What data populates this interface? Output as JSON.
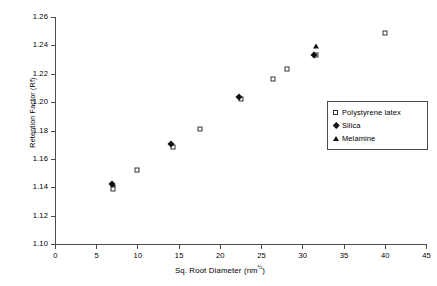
{
  "chart_data": {
    "type": "scatter",
    "title": "",
    "xlabel": "Sq. Root Diameter (nm",
    "xlabel_sup": "½",
    "xlabel_suffix": ")",
    "ylabel": "Retention Factor (Rf)",
    "xlim": [
      0,
      45
    ],
    "ylim": [
      1.1,
      1.26
    ],
    "xticks": [
      0,
      5,
      10,
      15,
      20,
      25,
      30,
      35,
      40,
      45
    ],
    "xtick_labels": [
      "0",
      "5",
      "10",
      "15",
      "20",
      "25",
      "30",
      "35",
      "40",
      "45"
    ],
    "yticks": [
      1.1,
      1.12,
      1.14,
      1.16,
      1.18,
      1.2,
      1.22,
      1.24,
      1.26
    ],
    "ytick_labels": [
      "1.10",
      "1.12",
      "1.14",
      "1.16",
      "1.18",
      "1.20",
      "1.22",
      "1.24",
      "1.26"
    ],
    "grid": false,
    "legend_position": "right-inside",
    "series": [
      {
        "name": "Polystyrene latex",
        "marker": "open-square",
        "color": "#333333",
        "points": [
          {
            "x": 7.0,
            "y": 1.1385
          },
          {
            "x": 10.0,
            "y": 1.152
          },
          {
            "x": 14.3,
            "y": 1.1685
          },
          {
            "x": 17.6,
            "y": 1.181
          },
          {
            "x": 22.6,
            "y": 1.202
          },
          {
            "x": 26.4,
            "y": 1.216
          },
          {
            "x": 28.1,
            "y": 1.223
          },
          {
            "x": 31.6,
            "y": 1.233
          },
          {
            "x": 40.0,
            "y": 1.249
          }
        ]
      },
      {
        "name": "Silica",
        "marker": "filled-diamond",
        "color": "#111111",
        "points": [
          {
            "x": 6.9,
            "y": 1.142
          },
          {
            "x": 14.1,
            "y": 1.1705
          },
          {
            "x": 22.3,
            "y": 1.2035
          },
          {
            "x": 31.4,
            "y": 1.2335
          }
        ]
      },
      {
        "name": "Melamine",
        "marker": "filled-triangle",
        "color": "#111111",
        "points": [
          {
            "x": 7.0,
            "y": 1.1425
          },
          {
            "x": 31.6,
            "y": 1.2395
          }
        ]
      }
    ]
  },
  "legend": {
    "items": [
      {
        "label": "Polystyrene latex",
        "marker": "open-square"
      },
      {
        "label": "Silica",
        "marker": "filled-diamond"
      },
      {
        "label": "Melamine",
        "marker": "filled-triangle"
      }
    ]
  }
}
